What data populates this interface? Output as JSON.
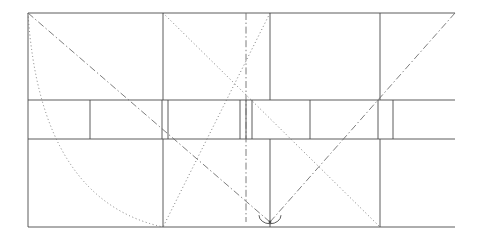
{
  "figure": {
    "background_color": "#ffffff",
    "stroke_color": "#4a4a4a",
    "stroke_color_light": "#6e6e6e",
    "stroke_width": "0.9",
    "canvas": {
      "width": 485,
      "height": 239
    }
  },
  "frame": {
    "name": "outer-rectangle",
    "left": 28,
    "right": 455,
    "top": 13,
    "bottom": 227,
    "width": 427,
    "height": 214
  },
  "horizontal_lines": [
    {
      "id": "top-edge",
      "y": 13,
      "x1": 28,
      "x2": 455,
      "style": "solid"
    },
    {
      "id": "band-top-edge",
      "y": 100,
      "x1": 28,
      "x2": 455,
      "style": "solid"
    },
    {
      "id": "band-bottom-edge",
      "y": 139,
      "x1": 28,
      "x2": 455,
      "style": "solid"
    },
    {
      "id": "bottom-edge",
      "y": 227,
      "x1": 28,
      "x2": 455,
      "style": "solid"
    }
  ],
  "vertical_lines": [
    {
      "id": "left-edge",
      "x": 28,
      "y1": 13,
      "y2": 227,
      "style": "solid"
    },
    {
      "id": "upper-divider-a",
      "x": 163,
      "y1": 13,
      "y2": 100,
      "style": "solid"
    },
    {
      "id": "upper-divider-b",
      "x": 270,
      "y1": 13,
      "y2": 100,
      "style": "solid"
    },
    {
      "id": "upper-divider-c",
      "x": 380,
      "y1": 13,
      "y2": 100,
      "style": "solid"
    },
    {
      "id": "band-divider-1",
      "x": 90,
      "y1": 100,
      "y2": 139,
      "style": "solid"
    },
    {
      "id": "band-divider-2",
      "x": 162,
      "y1": 100,
      "y2": 139,
      "style": "solid"
    },
    {
      "id": "band-divider-3",
      "x": 168,
      "y1": 100,
      "y2": 139,
      "style": "solid"
    },
    {
      "id": "band-divider-4",
      "x": 240,
      "y1": 100,
      "y2": 139,
      "style": "solid"
    },
    {
      "id": "band-divider-5",
      "x": 246,
      "y1": 100,
      "y2": 139,
      "style": "solid"
    },
    {
      "id": "band-divider-6",
      "x": 252,
      "y1": 100,
      "y2": 139,
      "style": "solid"
    },
    {
      "id": "band-divider-7",
      "x": 310,
      "y1": 100,
      "y2": 139,
      "style": "solid"
    },
    {
      "id": "band-divider-8",
      "x": 378,
      "y1": 100,
      "y2": 139,
      "style": "solid"
    },
    {
      "id": "band-divider-9",
      "x": 393,
      "y1": 100,
      "y2": 139,
      "style": "solid"
    },
    {
      "id": "lower-divider-a",
      "x": 163,
      "y1": 139,
      "y2": 227,
      "style": "solid"
    },
    {
      "id": "lower-divider-b",
      "x": 270,
      "y1": 139,
      "y2": 227,
      "style": "solid"
    },
    {
      "id": "lower-divider-c",
      "x": 380,
      "y1": 139,
      "y2": 227,
      "style": "solid"
    }
  ],
  "axis_line": {
    "id": "center-axis",
    "x": 246,
    "y1": 13,
    "y2": 222,
    "style": "dash-dot"
  },
  "diagonals": [
    {
      "id": "diagonal-main-descending",
      "x1": 28,
      "y1": 13,
      "x2": 270,
      "y2": 222,
      "style": "dash-dot"
    },
    {
      "id": "diagonal-main-ascending",
      "x1": 455,
      "y1": 13,
      "x2": 270,
      "y2": 222,
      "style": "dash-dot"
    },
    {
      "id": "diagonal-dotted-left",
      "x1": 163,
      "y1": 13,
      "x2": 380,
      "y2": 227,
      "style": "dotted"
    },
    {
      "id": "diagonal-dotted-right",
      "x1": 270,
      "y1": 13,
      "x2": 163,
      "y2": 227,
      "style": "dotted"
    }
  ],
  "curve": {
    "id": "parabolic-arc",
    "style": "dotted",
    "start": {
      "x": 28,
      "y": 13
    },
    "control": {
      "x": 40,
      "y": 200
    },
    "end": {
      "x": 163,
      "y": 227
    }
  },
  "angle_marker": {
    "id": "vertex-angle-arc",
    "vertex": {
      "x": 270,
      "y": 222
    },
    "radius": 11,
    "style": "solid"
  },
  "vertex_points": [
    {
      "id": "apex-vertex",
      "x": 270,
      "y": 222
    }
  ]
}
